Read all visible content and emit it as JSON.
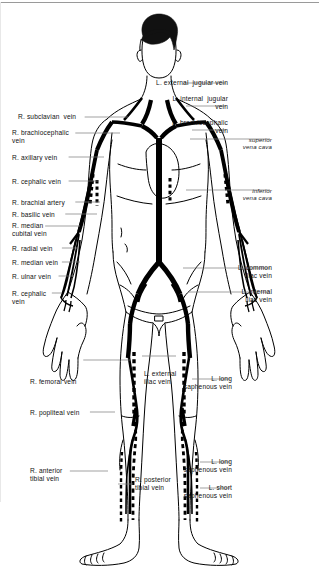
{
  "figure": {
    "line_color": "#000000",
    "leader_color": "#6e6e6e",
    "background": "#ffffff",
    "hair_color": "#111111"
  },
  "labels_left": [
    {
      "id": "r-subclavian-vein",
      "text": "R. subclavian  vein",
      "x": 18,
      "y": 113,
      "leader_to_x": 128,
      "leader_y": 117
    },
    {
      "id": "r-brachiocephalic-vein",
      "text": "R. brachiocephalic\nvein",
      "x": 12,
      "y": 129,
      "leader_to_x": 120,
      "leader_y": 133
    },
    {
      "id": "r-axillary-vein",
      "text": "R. axillary vein",
      "x": 12,
      "y": 154,
      "leader_to_x": 104,
      "leader_y": 157
    },
    {
      "id": "r-cephalic-vein-upper",
      "text": "R. cephalic vein",
      "x": 12,
      "y": 178,
      "leader_to_x": 98,
      "leader_y": 181
    },
    {
      "id": "r-brachial-artery",
      "text": "R. brachial artery",
      "x": 12,
      "y": 199,
      "leader_to_x": 100,
      "leader_y": 202
    },
    {
      "id": "r-basilic-vein",
      "text": "R. basilic vein",
      "x": 12,
      "y": 211,
      "leader_to_x": 97,
      "leader_y": 214
    },
    {
      "id": "r-median-cubital-vein",
      "text": "R. median\ncubital vein",
      "x": 12,
      "y": 222,
      "leader_to_x": 80,
      "leader_y": 226
    },
    {
      "id": "r-radial-vein",
      "text": "R. radial vein",
      "x": 12,
      "y": 245,
      "leader_to_x": 78,
      "leader_y": 248
    },
    {
      "id": "r-median-vein",
      "text": "R. median vein",
      "x": 12,
      "y": 259,
      "leader_to_x": 80,
      "leader_y": 262
    },
    {
      "id": "r-ulnar-vein",
      "text": "R. ulnar vein",
      "x": 12,
      "y": 273,
      "leader_to_x": 74,
      "leader_y": 276
    },
    {
      "id": "r-cephalic-vein-lower",
      "text": "R. cephalic\nvein",
      "x": 12,
      "y": 290,
      "leader_to_x": 62,
      "leader_y": 293
    },
    {
      "id": "r-femoral-vein",
      "text": "R. femoral vein",
      "x": 30,
      "y": 378,
      "leader_to_x": 130,
      "leader_y": 360
    },
    {
      "id": "r-popliteal-vein",
      "text": "R. popliteal vein",
      "x": 30,
      "y": 409,
      "leader_to_x": 115,
      "leader_y": 412
    },
    {
      "id": "r-anterior-tibial-vein",
      "text": "R. anterior\ntibial vein",
      "x": 30,
      "y": 467,
      "leader_to_x": 108,
      "leader_y": 471
    }
  ],
  "labels_center": [
    {
      "id": "l-external-iliac-vein",
      "text": "L. external\niliac vein",
      "x": 144,
      "y": 370,
      "leader_to_x": 176,
      "leader_y": 356
    },
    {
      "id": "r-posterior-tibial-vein",
      "text": "R. posterior\ntibial vein",
      "x": 135,
      "y": 476,
      "leader_to_x": 118,
      "leader_y": 484
    }
  ],
  "labels_right": [
    {
      "id": "l-external-jugular-vein",
      "text": "L. external  jugular vein",
      "x": 228,
      "y": 79,
      "leader_to_x": 183,
      "leader_y": 83
    },
    {
      "id": "l-internal-jugular-vein",
      "text": "L. internal  jugular\nvein",
      "x": 228,
      "y": 95,
      "leader_to_x": 186,
      "leader_y": 106
    },
    {
      "id": "l-brachiocephalic-vein",
      "text": "L. brachiocephalic\nvein",
      "x": 228,
      "y": 119,
      "leader_to_x": 192,
      "leader_y": 130
    },
    {
      "id": "superior-vena-cava",
      "text": "superior\nvena cava",
      "x": 272,
      "y": 136,
      "leader_to_x": 190,
      "leader_y": 139,
      "italic": true
    },
    {
      "id": "inferior-vena-cava",
      "text": "inferior\nvena cava",
      "x": 272,
      "y": 187,
      "leader_to_x": 186,
      "leader_y": 190,
      "italic": true
    },
    {
      "id": "l-common-iliac-vein",
      "text": "L. common\niliac vein",
      "x": 272,
      "y": 264,
      "leader_to_x": 183,
      "leader_y": 268,
      "italic": false
    },
    {
      "id": "l-internal-iliac-vein",
      "text": "L. internal\niliac vein",
      "x": 272,
      "y": 288,
      "leader_to_x": 188,
      "leader_y": 292
    },
    {
      "id": "l-long-saphenous-vein-thigh",
      "text": "L. long\nsaphenous vein",
      "x": 232,
      "y": 375,
      "leader_to_x": 192,
      "leader_y": 379
    },
    {
      "id": "l-long-saphenous-vein-leg",
      "text": "L. long\nsaphenous vein",
      "x": 232,
      "y": 458,
      "leader_to_x": 200,
      "leader_y": 462
    },
    {
      "id": "l-short-saphenous-vein",
      "text": "L. short\nsaphenous vein",
      "x": 232,
      "y": 484,
      "leader_to_x": 200,
      "leader_y": 488
    }
  ]
}
